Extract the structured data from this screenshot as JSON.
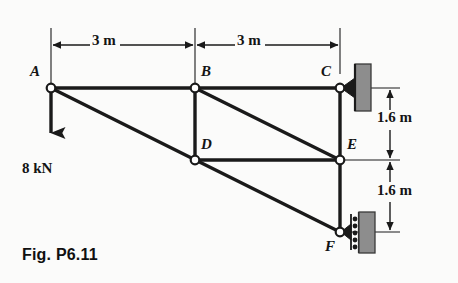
{
  "figure": {
    "caption": "Fig. P6.11",
    "type": "statics-truss-diagram"
  },
  "joints": [
    {
      "id": "A",
      "label": "A",
      "x": 51,
      "y": 88,
      "label_x": 30,
      "label_y": 64
    },
    {
      "id": "B",
      "label": "B",
      "x": 195,
      "y": 88,
      "label_x": 201,
      "label_y": 64
    },
    {
      "id": "C",
      "label": "C",
      "x": 340,
      "y": 88,
      "label_x": 321,
      "label_y": 64
    },
    {
      "id": "D",
      "label": "D",
      "x": 195,
      "y": 160,
      "label_x": 201,
      "label_y": 137
    },
    {
      "id": "E",
      "label": "E",
      "x": 340,
      "y": 160,
      "label_x": 347,
      "label_y": 137
    },
    {
      "id": "F",
      "label": "F",
      "x": 340,
      "y": 232,
      "label_x": 325,
      "label_y": 239
    }
  ],
  "members": [
    {
      "from": "A",
      "to": "B"
    },
    {
      "from": "B",
      "to": "C"
    },
    {
      "from": "A",
      "to": "F"
    },
    {
      "from": "B",
      "to": "D"
    },
    {
      "from": "B",
      "to": "E"
    },
    {
      "from": "D",
      "to": "E"
    },
    {
      "from": "C",
      "to": "E"
    },
    {
      "from": "E",
      "to": "F"
    }
  ],
  "supports": [
    {
      "at": "C",
      "kind": "pin",
      "wall_side": "right"
    },
    {
      "at": "F",
      "kind": "roller",
      "wall_side": "right"
    }
  ],
  "load": {
    "at": "A",
    "label": "8 kN",
    "direction": "down",
    "magnitude": 8,
    "unit": "kN",
    "label_x": 22,
    "label_y": 160
  },
  "dimensions": {
    "horizontal": [
      {
        "label": "3 m",
        "from": "A",
        "to": "B",
        "value": 3,
        "unit": "m",
        "label_x": 104,
        "label_y": 33
      },
      {
        "label": "3 m",
        "from": "B",
        "to": "C",
        "value": 3,
        "unit": "m",
        "label_x": 249,
        "label_y": 33
      }
    ],
    "vertical": [
      {
        "label": "1.6 m",
        "from": "C",
        "to": "E",
        "value": 1.6,
        "unit": "m",
        "label_x": 398,
        "label_y": 117
      },
      {
        "label": "1.6 m",
        "from": "E",
        "to": "F",
        "value": 1.6,
        "unit": "m",
        "label_x": 398,
        "label_y": 190
      }
    ]
  },
  "colors": {
    "line": "#1a1a1a",
    "wall_fill": "#8d8d8d",
    "wall_edge": "#3a3a3a",
    "joint_fill": "#ffffff",
    "background": "#fbfbfa",
    "dimension": "#1a1a1a"
  }
}
